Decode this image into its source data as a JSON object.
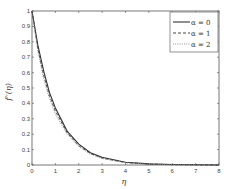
{
  "chart_data": {
    "type": "line",
    "title": "",
    "xlabel": "η",
    "ylabel": "f′′(η)",
    "xlim": [
      0,
      8
    ],
    "ylim": [
      0,
      1
    ],
    "xticks": [
      0,
      1,
      2,
      3,
      4,
      5,
      6,
      7,
      8
    ],
    "yticks": [
      0,
      0.1,
      0.2,
      0.3,
      0.4,
      0.5,
      0.6,
      0.7,
      0.8,
      0.9,
      1
    ],
    "grid": false,
    "legend_position": "upper right",
    "x": [
      0,
      0.25,
      0.5,
      0.75,
      1,
      1.5,
      2,
      2.5,
      3,
      4,
      5,
      6,
      7,
      8
    ],
    "series": [
      {
        "name": "α = 0",
        "style": "solid",
        "values": [
          1.0,
          0.78,
          0.61,
          0.47,
          0.37,
          0.22,
          0.135,
          0.08,
          0.05,
          0.018,
          0.007,
          0.003,
          0.001,
          0.0
        ]
      },
      {
        "name": "α = 1",
        "style": "dashed",
        "values": [
          1.0,
          0.76,
          0.58,
          0.45,
          0.35,
          0.21,
          0.125,
          0.075,
          0.045,
          0.016,
          0.006,
          0.002,
          0.001,
          0.0
        ]
      },
      {
        "name": "α = 2",
        "style": "dotted",
        "values": [
          1.0,
          0.74,
          0.56,
          0.43,
          0.33,
          0.2,
          0.12,
          0.07,
          0.042,
          0.015,
          0.005,
          0.002,
          0.001,
          0.0
        ]
      }
    ]
  },
  "legend": {
    "items": [
      "α = 0",
      "α = 1",
      "α = 2"
    ]
  },
  "axes": {
    "xlabel": "η",
    "ylabel": "f′′(η)"
  }
}
